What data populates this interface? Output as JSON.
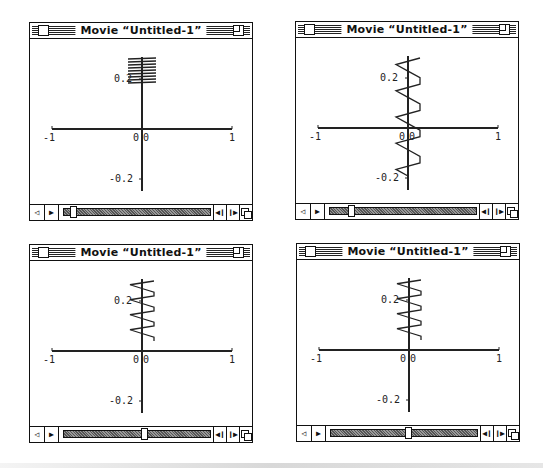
{
  "windows": [
    {
      "id": "top-left",
      "title": "Movie “Untitled-1”",
      "position": {
        "left": 29,
        "top": 22
      },
      "slider_position_pct": 0.04,
      "plot": {
        "x_ticks": [
          "-1",
          "0",
          "1"
        ],
        "y_ticks": [
          "0.2",
          "0",
          "-0.2"
        ],
        "y_origin_label": "0",
        "curve": "dense short horizontal strokes clustered near y≈0.22-0.28"
      }
    },
    {
      "id": "top-right",
      "title": "Movie “Untitled-1”",
      "position": {
        "left": 295,
        "top": 21
      },
      "slider_position_pct": 0.13,
      "plot": {
        "x_ticks": [
          "-1",
          "0",
          "1"
        ],
        "y_ticks": [
          "0.2",
          "0",
          "-0.2"
        ],
        "y_origin_label": "0",
        "curve": "zigzag triangles from y≈0.3 down to y≈-0.08"
      }
    },
    {
      "id": "bottom-left",
      "title": "Movie “Untitled-1”",
      "position": {
        "left": 29,
        "top": 244
      },
      "slider_position_pct": 0.55,
      "plot": {
        "x_ticks": [
          "-1",
          "0",
          "1"
        ],
        "y_ticks": [
          "0.2",
          "0",
          "-0.2"
        ],
        "y_origin_label": "0",
        "curve": "zigzag triangles from y≈0.28 down to y≈0.03"
      }
    },
    {
      "id": "bottom-right",
      "title": "Movie “Untitled-1”",
      "position": {
        "left": 296,
        "top": 243
      },
      "slider_position_pct": 0.53,
      "plot": {
        "x_ticks": [
          "-1",
          "0",
          "1"
        ],
        "y_ticks": [
          "0.2",
          "0",
          "-0.2"
        ],
        "y_origin_label": "0",
        "curve": "zigzag triangles from y≈0.28 down to y≈0.03"
      }
    }
  ],
  "controller": {
    "speaker_icon": "speaker-icon",
    "play_icon": "play-icon",
    "step_back_icon": "step-back-icon",
    "step_forward_icon": "step-forward-icon",
    "grow_icon": "size-box-icon",
    "play_glyph": "▶",
    "step_back_glyph": "◀❙",
    "step_fwd_glyph": "❙▶",
    "speaker_glyph": "◁"
  }
}
